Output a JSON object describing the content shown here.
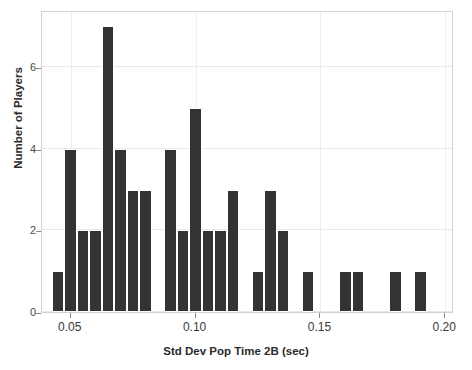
{
  "chart": {
    "title": "",
    "xlabel": "Std Dev Pop Time 2B (sec)",
    "ylabel": "Number of Players",
    "ytick_labels": [
      "0",
      "2",
      "4",
      "6"
    ],
    "xtick_labels": [
      "0.05",
      "0.10",
      "0.15",
      "0.20"
    ],
    "bar_color": "#333333",
    "grid_color": "#e9e9e9",
    "frame_color": "#d2d2d2"
  },
  "chart_data": {
    "type": "bar",
    "subtype": "histogram",
    "title": "",
    "xlabel": "Std Dev Pop Time 2B (sec)",
    "ylabel": "Number of Players",
    "xlim": [
      0.0385,
      0.2035
    ],
    "ylim": [
      0,
      7.4
    ],
    "xticks": [
      0.05,
      0.1,
      0.15,
      0.2
    ],
    "yticks": [
      0,
      2,
      4,
      6
    ],
    "grid": true,
    "legend": null,
    "bin_width": 0.005,
    "bin_starts": [
      0.0425,
      0.0475,
      0.0525,
      0.0575,
      0.0625,
      0.0675,
      0.0725,
      0.0775,
      0.0875,
      0.0925,
      0.0975,
      0.1025,
      0.1075,
      0.1125,
      0.1225,
      0.1275,
      0.1325,
      0.1425,
      0.1575,
      0.1625,
      0.1775,
      0.1875
    ],
    "values": [
      1,
      4,
      2,
      2,
      7,
      4,
      3,
      3,
      4,
      2,
      5,
      2,
      2,
      3,
      1,
      3,
      2,
      1,
      1,
      1,
      1,
      1
    ],
    "categories": [
      "0.0425",
      "0.0475",
      "0.0525",
      "0.0575",
      "0.0625",
      "0.0675",
      "0.0725",
      "0.0775",
      "0.0875",
      "0.0925",
      "0.0975",
      "0.1025",
      "0.1075",
      "0.1125",
      "0.1225",
      "0.1275",
      "0.1325",
      "0.1425",
      "0.1575",
      "0.1625",
      "0.1775",
      "0.1875"
    ],
    "total_count": 57
  }
}
